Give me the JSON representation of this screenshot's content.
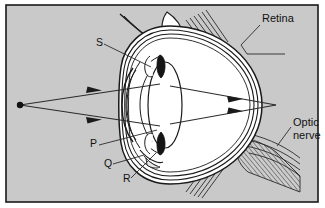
{
  "figure": {
    "frame": {
      "background_color": "#c9c9c9",
      "border_color": "#1a1a1a",
      "outer_color": "#ffffff"
    },
    "colors": {
      "ink": "#1a1a1a",
      "interior_white": "#ffffff",
      "ray_line": "#2b2b2b",
      "hatch": "#3a3a3a",
      "shade": "#b4b4b4"
    },
    "labels": [
      {
        "id": "retina",
        "text": "Retina",
        "x": 262,
        "y": 22,
        "kind": "name",
        "anchor": "start"
      },
      {
        "id": "optic-nerve-1",
        "text": "Optic",
        "x": 293,
        "y": 126,
        "kind": "name",
        "anchor": "start"
      },
      {
        "id": "optic-nerve-2",
        "text": "nerve",
        "x": 293,
        "y": 139,
        "kind": "name",
        "anchor": "start"
      },
      {
        "id": "label-s",
        "text": "S",
        "x": 96,
        "y": 46,
        "kind": "letter",
        "anchor": "start"
      },
      {
        "id": "label-p",
        "text": "P",
        "x": 90,
        "y": 147,
        "kind": "letter",
        "anchor": "start"
      },
      {
        "id": "label-q",
        "text": "Q",
        "x": 104,
        "y": 167,
        "kind": "letter",
        "anchor": "start"
      },
      {
        "id": "label-r",
        "text": "R",
        "x": 123,
        "y": 182,
        "kind": "letter",
        "anchor": "start"
      }
    ],
    "light_source": {
      "x": 20,
      "y": 105,
      "radius": 3
    },
    "rays": [
      {
        "id": "ray-upper-incident",
        "from_x": 20,
        "from_y": 105,
        "to_x": 132,
        "to_y": 87,
        "arrow_at": 0.62
      },
      {
        "id": "ray-lower-incident",
        "from_x": 20,
        "from_y": 105,
        "to_x": 132,
        "to_y": 124,
        "arrow_at": 0.62
      },
      {
        "id": "ray-upper-exit",
        "from_x": 170,
        "from_y": 88,
        "to_x": 276,
        "to_y": 105,
        "arrow_at": 0.6
      },
      {
        "id": "ray-lower-exit",
        "from_x": 170,
        "from_y": 123,
        "to_x": 276,
        "to_y": 105,
        "arrow_at": 0.6
      }
    ],
    "leaders": [
      {
        "id": "leader-retina",
        "points": "260,25 240,44 247,52 284,52"
      },
      {
        "id": "leader-optic-nerve",
        "points": "291,128 278,144"
      },
      {
        "id": "leader-s",
        "points": "104,45 150,66"
      },
      {
        "id": "leader-p",
        "points": "99,145 158,131"
      },
      {
        "id": "leader-q",
        "points": "113,165 143,156"
      },
      {
        "id": "leader-r",
        "points": "131,179 155,155"
      }
    ],
    "parts": [
      {
        "id": "retina-wall",
        "name": "Retina / sclera / choroid layers"
      },
      {
        "id": "optic-nerve",
        "name": "Optic nerve"
      },
      {
        "id": "lens",
        "name": "Lens (labelled P)"
      },
      {
        "id": "cornea",
        "name": "Cornea"
      },
      {
        "id": "iris",
        "name": "Iris (labelled R)"
      },
      {
        "id": "ciliary-muscle",
        "name": "Ciliary muscle (labelled S)"
      },
      {
        "id": "aqueous-humour",
        "name": "Aqueous humour (labelled Q)"
      },
      {
        "id": "vitreous-humour",
        "name": "Vitreous humour"
      }
    ]
  }
}
